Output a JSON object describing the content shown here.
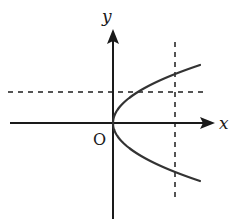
{
  "diagram": {
    "type": "coordinate-graph",
    "labels": {
      "x_axis": "x",
      "y_axis": "y",
      "origin": "O"
    },
    "curve": {
      "kind": "parabola",
      "equation_form": "y^2 = kx",
      "opens": "right",
      "vertex": "origin"
    },
    "reference_lines": [
      {
        "orientation": "vertical",
        "style": "dashed"
      },
      {
        "orientation": "horizontal",
        "style": "dashed"
      }
    ],
    "colors": {
      "axis": "#1a1a1a",
      "curve": "#333333",
      "dashed": "#555555",
      "background": "#ffffff"
    }
  }
}
